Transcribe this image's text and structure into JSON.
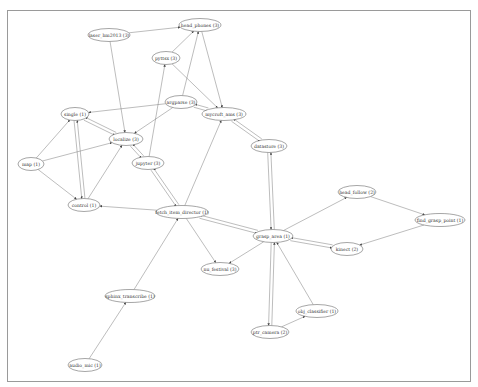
{
  "diagram": {
    "type": "directed-graph",
    "nodes": [
      {
        "id": "laser_hm2013",
        "label": "laser_hm2013 (3)",
        "x": 109,
        "y": 35,
        "rx": 21
      },
      {
        "id": "head_phones",
        "label": "head_phones (3)",
        "x": 200,
        "y": 25,
        "rx": 21
      },
      {
        "id": "pyttsx",
        "label": "pyttsx (3)",
        "x": 166,
        "y": 58,
        "rx": 14
      },
      {
        "id": "argparse",
        "label": "argparse (3)",
        "x": 181,
        "y": 102,
        "rx": 16
      },
      {
        "id": "mycroft_ams",
        "label": "mycroft_ams (3)",
        "x": 224,
        "y": 114,
        "rx": 22
      },
      {
        "id": "single",
        "label": "single (1)",
        "x": 75,
        "y": 114,
        "rx": 14
      },
      {
        "id": "localize",
        "label": "localize (3)",
        "x": 126,
        "y": 139,
        "rx": 17
      },
      {
        "id": "datastore",
        "label": "datastore (3)",
        "x": 269,
        "y": 146,
        "rx": 18
      },
      {
        "id": "map",
        "label": "map (1)",
        "x": 31,
        "y": 164,
        "rx": 13
      },
      {
        "id": "jupyter",
        "label": "jupyter (3)",
        "x": 148,
        "y": 163,
        "rx": 16
      },
      {
        "id": "control",
        "label": "control (1)",
        "x": 84,
        "y": 205,
        "rx": 16
      },
      {
        "id": "fetch_item_director",
        "label": "fetch_item_director (1)",
        "x": 182,
        "y": 212,
        "rx": 26
      },
      {
        "id": "head_follow",
        "label": "head_follow (2)",
        "x": 357,
        "y": 192,
        "rx": 19
      },
      {
        "id": "find_grasp_point",
        "label": "find_grasp_point (1)",
        "x": 440,
        "y": 220,
        "rx": 25
      },
      {
        "id": "grasp_area",
        "label": "grasp_area (1)",
        "x": 273,
        "y": 236,
        "rx": 20
      },
      {
        "id": "kinect",
        "label": "kinect (2)",
        "x": 347,
        "y": 249,
        "rx": 16
      },
      {
        "id": "nu_festival",
        "label": "nu_festival (3)",
        "x": 220,
        "y": 269,
        "rx": 19
      },
      {
        "id": "obj_classifier",
        "label": "obj_classifier (1)",
        "x": 317,
        "y": 311,
        "rx": 21
      },
      {
        "id": "ptr_camera",
        "label": "ptr_camera (2)",
        "x": 270,
        "y": 332,
        "rx": 19
      },
      {
        "id": "sphinx_transcribe",
        "label": "sphinx_transcribe (1)",
        "x": 130,
        "y": 296,
        "rx": 25
      },
      {
        "id": "audio_mic",
        "label": "audio_mic (1)",
        "x": 85,
        "y": 365,
        "rx": 17
      }
    ],
    "edges": [
      [
        "laser_hm2013",
        "head_phones"
      ],
      [
        "laser_hm2013",
        "localize"
      ],
      [
        "pyttsx",
        "head_phones"
      ],
      [
        "pyttsx",
        "mycroft_ams"
      ],
      [
        "argparse",
        "head_phones"
      ],
      [
        "argparse",
        "single"
      ],
      [
        "argparse",
        "localize"
      ],
      [
        "argparse",
        "mycroft_ams"
      ],
      [
        "head_phones",
        "mycroft_ams"
      ],
      [
        "mycroft_ams",
        "argparse"
      ],
      [
        "mycroft_ams",
        "datastore"
      ],
      [
        "datastore",
        "mycroft_ams"
      ],
      [
        "datastore",
        "grasp_area"
      ],
      [
        "grasp_area",
        "datastore"
      ],
      [
        "map",
        "single"
      ],
      [
        "map",
        "localize"
      ],
      [
        "map",
        "control"
      ],
      [
        "localize",
        "single"
      ],
      [
        "single",
        "localize"
      ],
      [
        "control",
        "single"
      ],
      [
        "single",
        "control"
      ],
      [
        "control",
        "localize"
      ],
      [
        "jupyter",
        "localize"
      ],
      [
        "localize",
        "jupyter"
      ],
      [
        "jupyter",
        "pyttsx"
      ],
      [
        "jupyter",
        "fetch_item_director"
      ],
      [
        "fetch_item_director",
        "jupyter"
      ],
      [
        "fetch_item_director",
        "control"
      ],
      [
        "fetch_item_director",
        "mycroft_ams"
      ],
      [
        "fetch_item_director",
        "nu_festival"
      ],
      [
        "fetch_item_director",
        "grasp_area"
      ],
      [
        "grasp_area",
        "fetch_item_director"
      ],
      [
        "grasp_area",
        "nu_festival"
      ],
      [
        "grasp_area",
        "head_follow"
      ],
      [
        "grasp_area",
        "kinect"
      ],
      [
        "kinect",
        "grasp_area"
      ],
      [
        "head_follow",
        "find_grasp_point"
      ],
      [
        "find_grasp_point",
        "kinect"
      ],
      [
        "grasp_area",
        "ptr_camera"
      ],
      [
        "ptr_camera",
        "grasp_area"
      ],
      [
        "ptr_camera",
        "obj_classifier"
      ],
      [
        "obj_classifier",
        "grasp_area"
      ],
      [
        "sphinx_transcribe",
        "fetch_item_director"
      ],
      [
        "audio_mic",
        "sphinx_transcribe"
      ]
    ]
  }
}
